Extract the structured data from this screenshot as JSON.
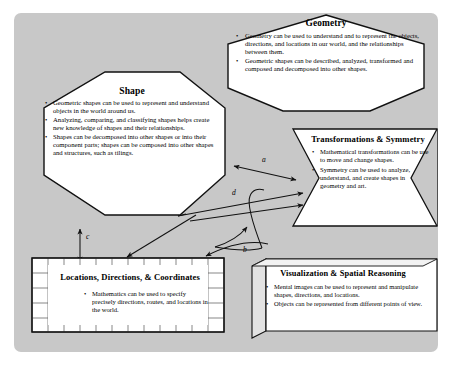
{
  "diagram": {
    "panel_color": "#c8c8c8",
    "page_color": "#ffffff",
    "node_fill": "#ffffff",
    "stroke_color": "#000000"
  },
  "nodes": {
    "geometry": {
      "shape": "hexagon",
      "title": "Geometry",
      "bullets": [
        "Geometry can be used to understand and to represent the objects, directions, and locations in our world, and the relationships between them.",
        "Geometric shapes can be described, analyzed, transformed and composed and decomposed into other shapes."
      ]
    },
    "shape": {
      "shape": "octagon",
      "title": "Shape",
      "bullets": [
        "Geometric shapes can be used to represent and understand objects in the world around us.",
        "Analyzing, comparing, and classifying shapes helps create new knowledge of shapes and their relationships.",
        "Shapes can be decomposed into other shapes or into their component parts; shapes can be composed into other shapes and structures, such as tilings."
      ]
    },
    "transformations": {
      "shape": "chevron",
      "title": "Transformations & Symmetry",
      "bullets": [
        "Mathematical transformations can be use to move and change shapes.",
        "Symmetry can be used to analyze, understand, and create shapes in geometry and art."
      ]
    },
    "locations": {
      "shape": "grid-box",
      "title": "Locations, Directions, & Coordinates",
      "bullets": [
        "Mathematics can be used to specify precisely directions, routes, and locations in the world."
      ]
    },
    "visualization": {
      "shape": "3d-box",
      "title": "Visualization & Spatial Reasoning",
      "bullets": [
        "Mental images can be used to represent and manipulate shapes, directions, and locations.",
        "Objects can be represented from different points of view."
      ]
    }
  },
  "edges": [
    {
      "id": "a",
      "label": "a",
      "kind": "double-arrow",
      "from": "shape",
      "to": "transformations"
    },
    {
      "id": "b",
      "label": "b",
      "kind": "arrow",
      "from": "visualization",
      "to": "shape"
    },
    {
      "id": "c",
      "label": "c",
      "kind": "double-arrow",
      "from": "shape",
      "to": "locations"
    },
    {
      "id": "d",
      "label": "d",
      "kind": "arrow",
      "from": "locations",
      "to": "transformations"
    },
    {
      "id": "e",
      "label": "",
      "kind": "arrow",
      "from": "shape",
      "to": "locations"
    },
    {
      "id": "f",
      "label": "",
      "kind": "arrow",
      "from": "visualization",
      "to": "locations"
    }
  ]
}
